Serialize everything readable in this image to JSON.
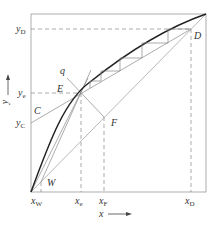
{
  "diagram": {
    "type": "McCabe-Thiele distillation diagram",
    "axis": {
      "x_label": "x",
      "y_label": "y"
    },
    "points": {
      "D": {
        "label": "D"
      },
      "E": {
        "label": "E"
      },
      "F": {
        "label": "F"
      },
      "C": {
        "label": "C"
      },
      "W": {
        "label": "W"
      },
      "q": {
        "label": "q"
      }
    },
    "y_ticks": [
      {
        "base": "y",
        "sub": "D"
      },
      {
        "base": "y",
        "sub": "e"
      },
      {
        "base": "y",
        "sub": "C"
      }
    ],
    "x_ticks": [
      {
        "base": "x",
        "sub": "W"
      },
      {
        "base": "x",
        "sub": "e"
      },
      {
        "base": "x",
        "sub": "F"
      },
      {
        "base": "x",
        "sub": "D"
      }
    ],
    "colors": {
      "line": "#888888",
      "curve": "#222222",
      "frame": "#999999"
    }
  }
}
